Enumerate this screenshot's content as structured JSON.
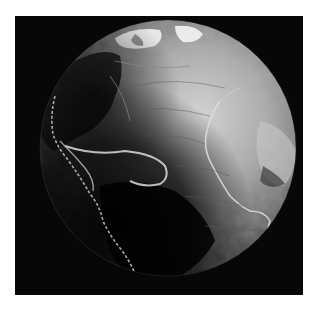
{
  "image": {
    "subject": "grayscale relief globe showing Atlantic Ocean floor and mid-ocean ridge",
    "background_color": "#ffffff",
    "frame_color": "#070707",
    "globe": {
      "center": [
        153,
        132
      ],
      "radius": 128,
      "lit_color": "#e6e6e6",
      "mid_color": "#8a8a8a",
      "shadow_color": "#0a0a0a"
    },
    "features": [
      {
        "name": "mid-atlantic-ridge",
        "color": "#d8d8d8"
      },
      {
        "name": "caribbean-arc",
        "color": "#cfcfcf"
      },
      {
        "name": "americas-coastline",
        "color": "#bdbdbd"
      },
      {
        "name": "north-polar-ice",
        "color": "#f4f4f4"
      },
      {
        "name": "africa-coast",
        "color": "#a0a0a0"
      }
    ]
  }
}
